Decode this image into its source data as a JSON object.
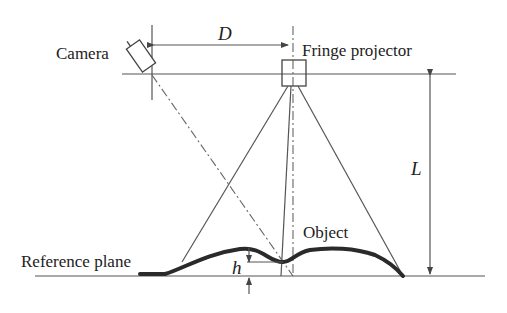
{
  "figure": {
    "labels": {
      "camera": "Camera",
      "fringe_projector": "Fringe projector",
      "reference_plane": "Reference plane",
      "object": "Object",
      "distance_D": "D",
      "distance_L": "L",
      "height_h": "h"
    },
    "components": [
      "camera",
      "fringe-projector",
      "reference-plane",
      "object-surface"
    ],
    "colors": {
      "line": "#555555",
      "surface": "#2a2a2a",
      "background": "#ffffff"
    }
  }
}
